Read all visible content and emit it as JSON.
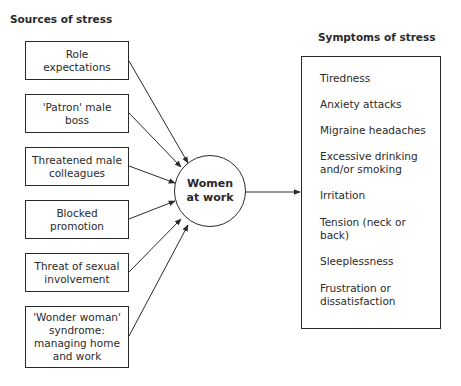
{
  "diagram": {
    "sources_heading": "Sources of stress",
    "symptoms_heading": "Symptoms of stress",
    "hub": {
      "line1": "Women",
      "line2": "at work"
    },
    "sources": [
      {
        "lines": [
          "Role",
          "expectations"
        ]
      },
      {
        "lines": [
          "'Patron' male",
          "boss"
        ]
      },
      {
        "lines": [
          "Threatened male",
          "colleagues"
        ]
      },
      {
        "lines": [
          "Blocked",
          "promotion"
        ]
      },
      {
        "lines": [
          "Threat of sexual",
          "involvement"
        ]
      },
      {
        "lines": [
          "'Wonder woman'",
          "syndrome:",
          "managing home",
          "and work"
        ]
      }
    ],
    "symptoms": [
      {
        "lines": [
          "Tiredness"
        ]
      },
      {
        "lines": [
          "Anxiety attacks"
        ]
      },
      {
        "lines": [
          "Migraine headaches"
        ]
      },
      {
        "lines": [
          "Excessive drinking",
          "and/or smoking"
        ]
      },
      {
        "lines": [
          "Irritation"
        ]
      },
      {
        "lines": [
          "Tension (neck or",
          "back)"
        ]
      },
      {
        "lines": [
          "Sleeplessness"
        ]
      },
      {
        "lines": [
          "Frustration or",
          "dissatisfaction"
        ]
      }
    ],
    "colors": {
      "stroke": "#2a2a2a",
      "background": "#ffffff"
    }
  }
}
